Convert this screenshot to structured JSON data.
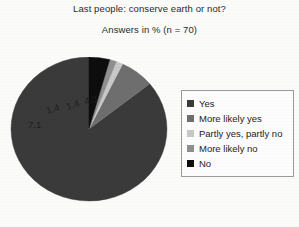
{
  "chart_data": {
    "type": "pie",
    "title": "Last people: conserve earth or not?",
    "subtitle": "Answers in % (n = 70)",
    "unit": "%",
    "n": 70,
    "legend_position": "right",
    "categories": [
      "Yes",
      "More likely yes",
      "Partly yes, partly no",
      "More likely no",
      "No"
    ],
    "values": [
      85.8,
      7.1,
      1.4,
      1.4,
      4.3
    ],
    "labels": [
      "85.8",
      "7.1",
      "1.4",
      "1.4",
      "4.3"
    ],
    "colors": [
      "#3a3a3a",
      "#6e6e6e",
      "#c8c8c8",
      "#8f8f8f",
      "#0d0d0d"
    ],
    "slices": [
      {
        "label": "Yes",
        "value": 85.8,
        "display": "85.8",
        "color": "#3a3a3a"
      },
      {
        "label": "More likely yes",
        "value": 7.1,
        "display": "7.1",
        "color": "#6e6e6e"
      },
      {
        "label": "Partly yes, partly no",
        "value": 1.4,
        "display": "1.4",
        "color": "#c8c8c8"
      },
      {
        "label": "More likely no",
        "value": 1.4,
        "display": "1.4",
        "color": "#8f8f8f"
      },
      {
        "label": "No",
        "value": 4.3,
        "display": "4.3",
        "color": "#0d0d0d"
      }
    ]
  },
  "legend": {
    "items": [
      {
        "label": "Yes",
        "color": "#3a3a3a"
      },
      {
        "label": "More likely yes",
        "color": "#6e6e6e"
      },
      {
        "label": "Partly yes, partly no",
        "color": "#c8c8c8"
      },
      {
        "label": "More likely no",
        "color": "#8f8f8f"
      },
      {
        "label": "No",
        "color": "#0d0d0d"
      }
    ]
  }
}
